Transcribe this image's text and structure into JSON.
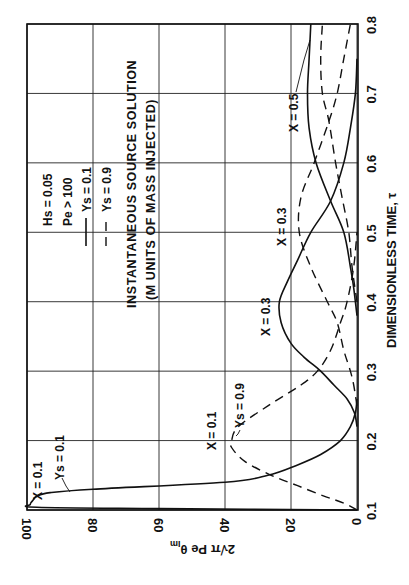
{
  "chart_data": {
    "type": "line",
    "orientation_note": "Figure printed rotated 90 degrees counter-clockwise",
    "title": "INSTANTANEOUS SOURCE SOLUTION",
    "subtitle": "(M UNITS OF MASS INJECTED)",
    "xlabel": "DIMENSIONLESS TIME, τ",
    "ylabel": "2√π Pe θIm",
    "xlim": [
      0.1,
      0.8
    ],
    "ylim": [
      0,
      100
    ],
    "xticks": [
      "0.1",
      "0.2",
      "0.3",
      "0.4",
      "0.5",
      "0.6",
      "0.7",
      "0.8"
    ],
    "yticks": [
      "0",
      "20",
      "40",
      "60",
      "80",
      "100"
    ],
    "grid": true,
    "parameters": [
      "Hs = 0.05",
      "Pe > 100"
    ],
    "legend": [
      {
        "style": "solid",
        "label": "Ys = 0.1"
      },
      {
        "style": "dashed",
        "label": "Ys = 0.9"
      }
    ],
    "series": [
      {
        "name": "X=0.1, Ys=0.1",
        "style": "solid",
        "x": [
          0.1,
          0.102,
          0.104,
          0.108,
          0.115,
          0.12,
          0.125,
          0.13,
          0.14,
          0.15,
          0.165,
          0.18,
          0.2,
          0.22,
          0.24,
          0.26
        ],
        "y": [
          0,
          60,
          97,
          99,
          98,
          97,
          93,
          80,
          40,
          27,
          18,
          11,
          5,
          2,
          0.5,
          0
        ]
      },
      {
        "name": "X=0.1, Ys=0.9",
        "style": "dashed",
        "x": [
          0.1,
          0.11,
          0.12,
          0.135,
          0.15,
          0.17,
          0.19,
          0.2,
          0.22,
          0.25,
          0.28,
          0.3,
          0.33,
          0.37,
          0.4,
          0.45,
          0.5
        ],
        "y": [
          0,
          4,
          10,
          18,
          26,
          34,
          38,
          38,
          36,
          27,
          17,
          12,
          8,
          5,
          3,
          1,
          0
        ]
      },
      {
        "name": "X=0.3, Ys=0.1",
        "style": "solid",
        "x": [
          0.22,
          0.24,
          0.26,
          0.28,
          0.3,
          0.32,
          0.34,
          0.37,
          0.4,
          0.43,
          0.46,
          0.5,
          0.545,
          0.6,
          0.65,
          0.7,
          0.75
        ],
        "y": [
          0,
          0.8,
          3,
          7,
          11,
          16,
          20,
          23,
          23.5,
          21,
          18,
          14,
          8,
          4,
          2,
          0.5,
          0
        ]
      },
      {
        "name": "X=0.3, Ys=0.9",
        "style": "dashed",
        "x": [
          0.25,
          0.28,
          0.3,
          0.33,
          0.37,
          0.4,
          0.45,
          0.5,
          0.55,
          0.6,
          0.66,
          0.7,
          0.75,
          0.8
        ],
        "y": [
          0,
          1,
          2,
          4,
          6,
          9,
          14,
          17.5,
          17,
          13,
          8.5,
          6,
          4,
          2
        ]
      },
      {
        "name": "X=0.5, Ys=0.1",
        "style": "solid",
        "x": [
          0.38,
          0.42,
          0.45,
          0.5,
          0.545,
          0.6,
          0.65,
          0.7,
          0.75,
          0.8
        ],
        "y": [
          0,
          1,
          2,
          4,
          8,
          12.4,
          14.5,
          15,
          14.5,
          14
        ]
      },
      {
        "name": "X=0.5, Ys=0.9",
        "style": "dashed",
        "x": [
          0.4,
          0.45,
          0.5,
          0.55,
          0.6,
          0.66,
          0.7,
          0.75,
          0.8
        ],
        "y": [
          0,
          1.5,
          2.5,
          4.5,
          6.5,
          8.5,
          10.5,
          11,
          10.5
        ]
      }
    ],
    "annotations": [
      "X = 0.1",
      "Ys = 0.1",
      "X = 0.1",
      "Ys = 0.9",
      "X = 0.3",
      "X = 0.3",
      "X = 0.5"
    ]
  },
  "labels": {
    "title": "INSTANTANEOUS SOURCE SOLUTION",
    "subtitle": "(M UNITS OF MASS INJECTED)",
    "xlabel": "DIMENSIONLESS TIME, τ",
    "ylabel_main": "2√π Pe θ",
    "ylabel_sub": "Im",
    "param1": "Hs = 0.05",
    "param2": "Pe > 100",
    "legend_solid": "Ys = 0.1",
    "legend_dashed": "Ys = 0.9",
    "ann_x01_solid": "X = 0.1",
    "ann_ys01": "Ys = 0.1",
    "ann_x01_dashed": "X = 0.1",
    "ann_ys09": "Ys = 0.9",
    "ann_x03_solid": "X = 0.3",
    "ann_x03_dashed": "X = 0.3",
    "ann_x05": "X = 0.5"
  }
}
